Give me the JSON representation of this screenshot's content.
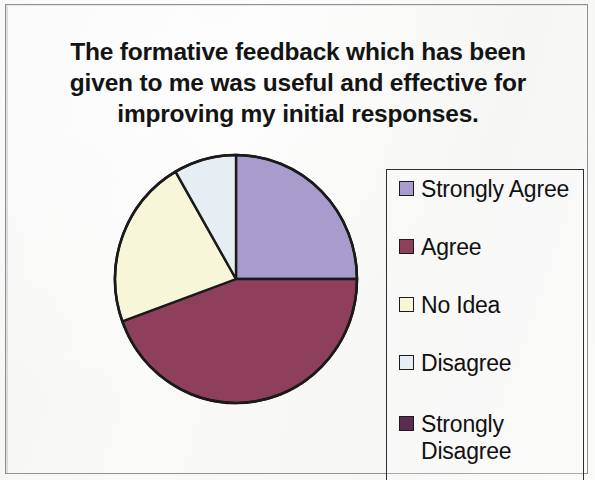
{
  "chart_title": "The formative feedback which has been given to me was useful and effective for improving my initial responses.",
  "legend": {
    "items": [
      {
        "label": "Strongly Agree",
        "color": "#a89ccc"
      },
      {
        "label": "Agree",
        "color": "#8d3f5c"
      },
      {
        "label": "No Idea",
        "color": "#f8f6d8"
      },
      {
        "label": "Disagree",
        "color": "#e6eef4"
      },
      {
        "label": "Strongly\nDisagree",
        "color": "#5c2c4e"
      }
    ]
  },
  "chart_data": {
    "type": "pie",
    "title": "The formative feedback which has been given to me was useful and effective for improving my initial responses.",
    "categories": [
      "Strongly Agree",
      "Agree",
      "No Idea",
      "Disagree",
      "Strongly Disagree"
    ],
    "values": [
      25,
      44.4,
      22.2,
      8.4,
      0
    ],
    "units": "percent",
    "colors": [
      "#a89ccc",
      "#8d3f5c",
      "#f8f6d8",
      "#e6eef4",
      "#5c2c4e"
    ],
    "start_angle_deg": 0,
    "direction": "clockwise",
    "slice_angles_deg": [
      90,
      160,
      80,
      30,
      0
    ],
    "legend_position": "right",
    "data_labels": false,
    "grid": false
  }
}
